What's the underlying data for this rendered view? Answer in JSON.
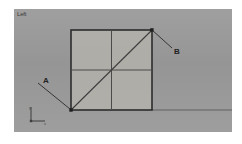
{
  "app": {
    "viewport_label": "Left",
    "background_color": "#ffffff",
    "viewport_color": "#9a9a9a"
  },
  "scene": {
    "annotations": [
      {
        "id": "a",
        "label": "A",
        "target": "square-bottom-left-vertex"
      },
      {
        "id": "b",
        "label": "B",
        "target": "square-top-right-vertex"
      }
    ],
    "axis_tripod": {
      "y_label": "y",
      "x_label": "x"
    },
    "geometry": {
      "name": "subdivided-plane",
      "description": "Square plane with 2x2 grid subdivision and a corner-to-corner diagonal edge",
      "fill_color": "#b4b2ac",
      "edge_color": "#2c2c2c",
      "grid_color": "#4a4a4a",
      "ground_line_color": "#3a3a3a"
    }
  }
}
